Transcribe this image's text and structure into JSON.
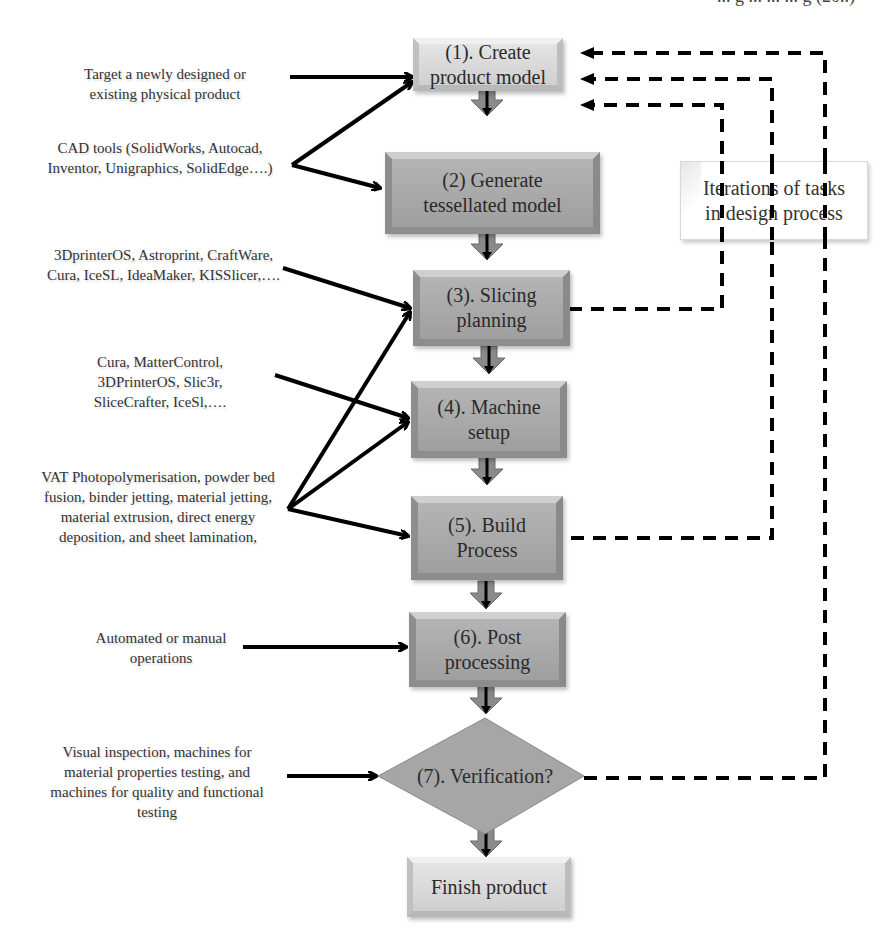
{
  "header": {
    "partial_text": "... g ... ... ... g (20..)"
  },
  "steps": [
    {
      "id": "create",
      "label": "(1). Create product model"
    },
    {
      "id": "tessellate",
      "label": "(2) Generate tessellated model"
    },
    {
      "id": "slicing",
      "label": "(3). Slicing planning"
    },
    {
      "id": "machine",
      "label": "(4). Machine setup"
    },
    {
      "id": "build",
      "label": "(5). Build Process"
    },
    {
      "id": "post",
      "label": "(6). Post processing"
    },
    {
      "id": "verify",
      "label": "(7). Verification?"
    },
    {
      "id": "finish",
      "label": "Finish product"
    }
  ],
  "inputs": [
    {
      "id": "target",
      "text": "Target a newly designed or existing physical product"
    },
    {
      "id": "cad",
      "text": "CAD tools (SolidWorks, Autocad, Inventor, Unigraphics, SolidEdge….)"
    },
    {
      "id": "slicers",
      "text": "3DprinterOS, Astroprint, CraftWare, Cura, IceSL, IdeaMaker, KISSlicer,…."
    },
    {
      "id": "hosts",
      "text": "Cura, MatterControl, 3DPrinterOS, Slic3r, SliceCrafter, IceSl,…."
    },
    {
      "id": "processes",
      "text": "VAT Photopolymerisation, powder bed fusion, binder jetting, material jetting, material extrusion, direct energy deposition, and sheet lamination,"
    },
    {
      "id": "operations",
      "text": "Automated or manual operations"
    },
    {
      "id": "inspection",
      "text": "Visual inspection, machines for material properties testing, and machines for quality and functional testing"
    }
  ],
  "note": {
    "text": "Iterations of tasks in design process"
  },
  "colors": {
    "light_box": "#d9d9d9",
    "dark_box": "#a8a8a8",
    "arrow": "#000000",
    "diamond": "#a6a6a6"
  }
}
